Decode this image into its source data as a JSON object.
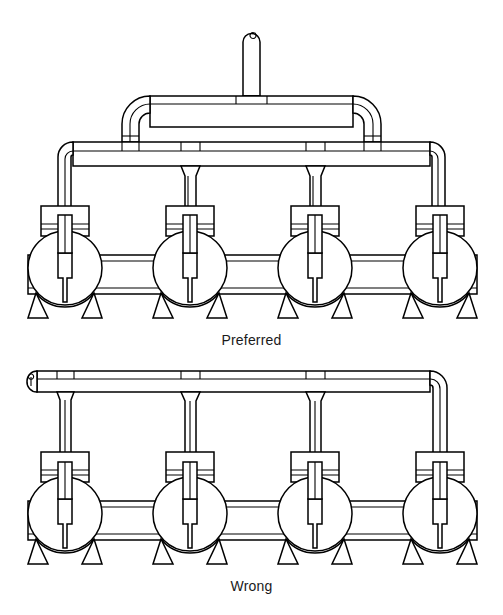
{
  "figure": {
    "type": "line-drawing",
    "background_color": "#ffffff",
    "line_color": "#000000",
    "panels": [
      {
        "id": "preferred",
        "caption": "Preferred",
        "caption_y": 332,
        "description": "Four centrifugal pumps on a common suction header with a symmetric elevated discharge manifold fed by a central vertical riser; branch drops are taken from the top of the header.",
        "pump_count": 4,
        "pump_centers_x": [
          65,
          190,
          315,
          440
        ],
        "pump_center_y": 268,
        "pump_radius": 37,
        "header_y": 151,
        "manifold_y": 104,
        "riser_x": 251,
        "riser_top_y": 30
      },
      {
        "id": "wrong",
        "caption": "Wrong",
        "caption_y": 578,
        "description": "Four centrifugal pumps fed from a single end-entry overhead header with a capped dead end at the left; branch drops hang directly from the run.",
        "pump_count": 4,
        "pump_centers_x": [
          65,
          190,
          315,
          440
        ],
        "pump_center_y": 514,
        "pump_radius": 37,
        "header_y": 380
      }
    ],
    "components": [
      {
        "name": "vertical-riser",
        "label": "Inlet riser with capped top"
      },
      {
        "name": "upper-manifold",
        "label": "Elevated distribution manifold"
      },
      {
        "name": "manifold-elbow-left",
        "label": "Left manifold elbow"
      },
      {
        "name": "manifold-elbow-right",
        "label": "Right manifold elbow"
      },
      {
        "name": "discharge-header",
        "label": "Discharge header"
      },
      {
        "name": "branch-drop",
        "label": "Branch drop pipe to pump"
      },
      {
        "name": "pump-volute",
        "label": "Pump volute casing"
      },
      {
        "name": "pump-motor-housing",
        "label": "Pump motor / bearing housing"
      },
      {
        "name": "pump-discharge-nozzle",
        "label": "Pump discharge nozzle"
      },
      {
        "name": "pump-legs",
        "label": "Pump support legs"
      },
      {
        "name": "suction-header",
        "label": "Common suction header"
      },
      {
        "name": "pipe-cap",
        "label": "Capped pipe end"
      }
    ]
  }
}
